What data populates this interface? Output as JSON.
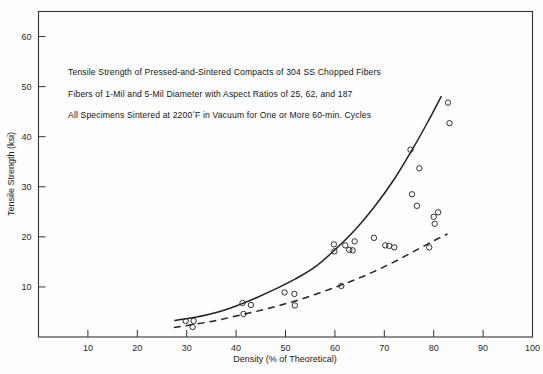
{
  "chart_data": {
    "type": "scatter",
    "title": "",
    "xlabel": "Density (% of Theoretical)",
    "ylabel": "Tensile Strength (ksi)",
    "xlim": [
      0,
      100
    ],
    "ylim": [
      0,
      65
    ],
    "xticks": [
      10,
      20,
      30,
      40,
      50,
      60,
      70,
      80,
      90,
      100
    ],
    "yticks": [
      10,
      20,
      30,
      40,
      50,
      60
    ],
    "grid": false,
    "legend": "none",
    "annotations": [
      "Tensile Strength of Pressed-and-Sintered Compacts of 304 SS Chopped Fibers",
      "Fibers of 1-Mil and 5-Mil Diameter with Aspect Ratios of 25, 62, and 187",
      "All Specimens Sintered at 2200°F in Vacuum for One or More 60-min. Cycles"
    ],
    "annotation_3_parts": {
      "before": "All Specimens Sintered at 2200",
      "degree": "°",
      "after": "F in Vacuum for One or More 60-min. Cycles"
    },
    "series": [
      {
        "name": "data-points",
        "marker": "open-circle",
        "points": [
          [
            29.8,
            3.2
          ],
          [
            31.4,
            3.2
          ],
          [
            31.2,
            2.0
          ],
          [
            41.3,
            6.8
          ],
          [
            41.5,
            4.6
          ],
          [
            43.0,
            6.4
          ],
          [
            49.8,
            8.9
          ],
          [
            51.8,
            8.6
          ],
          [
            51.9,
            6.3
          ],
          [
            59.8,
            18.5
          ],
          [
            59.9,
            17.1
          ],
          [
            61.3,
            10.2
          ],
          [
            62.1,
            18.3
          ],
          [
            62.9,
            17.4
          ],
          [
            63.6,
            17.3
          ],
          [
            64.0,
            19.1
          ],
          [
            67.9,
            19.8
          ],
          [
            70.2,
            18.3
          ],
          [
            71.0,
            18.2
          ],
          [
            72.0,
            17.9
          ],
          [
            75.3,
            37.4
          ],
          [
            75.6,
            28.5
          ],
          [
            76.6,
            26.2
          ],
          [
            77.1,
            33.7
          ],
          [
            79.1,
            17.9
          ],
          [
            80.0,
            24.0
          ],
          [
            80.2,
            22.6
          ],
          [
            80.9,
            24.9
          ],
          [
            82.9,
            46.8
          ],
          [
            83.2,
            42.7
          ]
        ]
      }
    ],
    "curves": [
      {
        "name": "upper-bound-solid",
        "style": "solid",
        "points": [
          [
            27.6,
            3.3
          ],
          [
            32.0,
            4.0
          ],
          [
            36.0,
            4.9
          ],
          [
            40.0,
            6.2
          ],
          [
            44.0,
            7.8
          ],
          [
            48.0,
            9.6
          ],
          [
            52.0,
            11.6
          ],
          [
            56.0,
            14.0
          ],
          [
            60.0,
            17.4
          ],
          [
            64.0,
            21.3
          ],
          [
            68.0,
            26.0
          ],
          [
            72.0,
            31.5
          ],
          [
            76.0,
            38.0
          ],
          [
            79.0,
            43.3
          ],
          [
            81.5,
            48.0
          ]
        ]
      },
      {
        "name": "lower-bound-dashed",
        "style": "dashed",
        "points": [
          [
            27.4,
            1.9
          ],
          [
            32.0,
            2.6
          ],
          [
            36.0,
            3.3
          ],
          [
            40.0,
            4.2
          ],
          [
            44.0,
            5.1
          ],
          [
            48.0,
            6.1
          ],
          [
            52.0,
            7.2
          ],
          [
            56.0,
            8.5
          ],
          [
            60.0,
            9.9
          ],
          [
            64.0,
            11.4
          ],
          [
            68.0,
            13.1
          ],
          [
            72.0,
            15.0
          ],
          [
            76.0,
            17.1
          ],
          [
            80.0,
            19.2
          ],
          [
            82.8,
            20.6
          ]
        ]
      }
    ]
  }
}
